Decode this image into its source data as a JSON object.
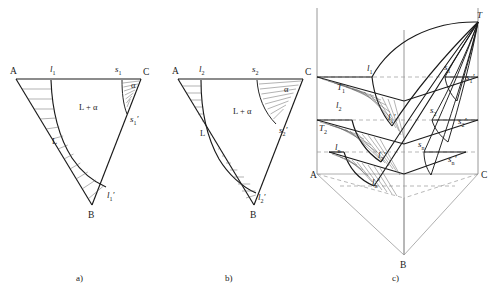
{
  "figure": {
    "caption_a": "a)",
    "caption_b": "b)",
    "caption_c": "c)"
  },
  "panel_a": {
    "vertex_A": "A",
    "vertex_B": "B",
    "vertex_C": "C",
    "liquidus_point": "l",
    "liquidus_sub": "1",
    "solidus_point": "s",
    "solidus_sub": "1",
    "liquidus_prime": "l",
    "liquidus_prime_sub": "1",
    "liquidus_prime_mark": "′",
    "solidus_prime": "s",
    "solidus_prime_sub": "1",
    "solidus_prime_mark": "′",
    "region_L": "L",
    "region_L_alpha": "L + α",
    "region_alpha": "α"
  },
  "panel_b": {
    "vertex_A": "A",
    "vertex_B": "B",
    "vertex_C": "C",
    "liquidus_point": "l",
    "liquidus_sub": "2",
    "solidus_point": "s",
    "solidus_sub": "2",
    "liquidus_prime": "l",
    "liquidus_prime_sub": "2",
    "liquidus_prime_mark": "′",
    "solidus_prime": "s",
    "solidus_prime_sub": "2",
    "solidus_prime_mark": "′",
    "region_L": "L",
    "region_L_alpha": "L + α",
    "region_alpha": "α"
  },
  "panel_c": {
    "vertex_A": "A",
    "vertex_B": "B",
    "vertex_C": "C",
    "apex_T": "T",
    "temp_1": "T",
    "temp_1_sub": "1",
    "temp_2": "T",
    "temp_2_sub": "2",
    "l1": "l",
    "l1_sub": "1",
    "l2": "l",
    "l2_sub": "2",
    "ln": "l",
    "ln_sub": "n",
    "l1p": "l",
    "l1p_sub": "1",
    "l1p_mark": "′",
    "l2p": "l",
    "l2p_sub": "2",
    "l2p_mark": "′",
    "lnp": "l",
    "lnp_sub": "n",
    "lnp_mark": "′",
    "s1": "s",
    "s1_sub": "1",
    "s2": "s",
    "s2_sub": "2",
    "sn": "s",
    "sn_sub": "n",
    "s1p": "s",
    "s1p_sub": "1",
    "s1p_mark": "′",
    "s2p": "s",
    "s2p_sub": "2",
    "s2p_mark": "′",
    "snp": "s",
    "snp_sub": "n",
    "snp_mark": "′"
  },
  "colors": {
    "ink": "#1a1a1a",
    "hatch": "#555555",
    "construction": "#9a9a9a",
    "background": "#ffffff"
  }
}
